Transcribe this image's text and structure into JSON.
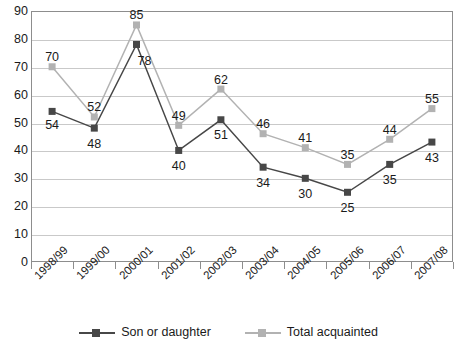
{
  "chart_data": {
    "type": "line",
    "title": "",
    "xlabel": "",
    "ylabel": "",
    "ylim": [
      0,
      90
    ],
    "ytick_step": 10,
    "yticks": [
      "90",
      "80",
      "70",
      "60",
      "50",
      "40",
      "30",
      "20",
      "10",
      "0"
    ],
    "grid": true,
    "legend_position": "bottom",
    "categories": [
      "1998/99",
      "1999/00",
      "2000/01",
      "2001/02",
      "2002/03",
      "2003/04",
      "2004/05",
      "2005/06",
      "2006/07",
      "2007/08"
    ],
    "series": [
      {
        "name": "Son or daughter",
        "color": "#474747",
        "marker": "square",
        "values": [
          54,
          48,
          78,
          40,
          51,
          34,
          30,
          25,
          35,
          43
        ],
        "label_offsets": [
          {
            "dx": 0,
            "dy": 14
          },
          {
            "dx": 0,
            "dy": 16
          },
          {
            "dx": 8,
            "dy": 17
          },
          {
            "dx": 0,
            "dy": 16
          },
          {
            "dx": 0,
            "dy": 16
          },
          {
            "dx": 0,
            "dy": 16
          },
          {
            "dx": 0,
            "dy": 16
          },
          {
            "dx": 0,
            "dy": 16
          },
          {
            "dx": 0,
            "dy": 16
          },
          {
            "dx": 0,
            "dy": 16
          }
        ]
      },
      {
        "name": "Total acquainted",
        "color": "#b2b2b2",
        "marker": "square",
        "values": [
          70,
          52,
          85,
          49,
          62,
          46,
          41,
          35,
          44,
          55
        ],
        "label_offsets": [
          {
            "dx": 0,
            "dy": -9
          },
          {
            "dx": 0,
            "dy": -9
          },
          {
            "dx": 0,
            "dy": -9
          },
          {
            "dx": 0,
            "dy": -9
          },
          {
            "dx": 0,
            "dy": -9
          },
          {
            "dx": 0,
            "dy": -9
          },
          {
            "dx": 0,
            "dy": -9
          },
          {
            "dx": 0,
            "dy": -9
          },
          {
            "dx": 0,
            "dy": -9
          },
          {
            "dx": 0,
            "dy": -9
          }
        ]
      }
    ]
  },
  "legend": {
    "items": [
      {
        "label": "Son or daughter",
        "color": "#474747"
      },
      {
        "label": "Total acquainted",
        "color": "#b2b2b2"
      }
    ]
  }
}
